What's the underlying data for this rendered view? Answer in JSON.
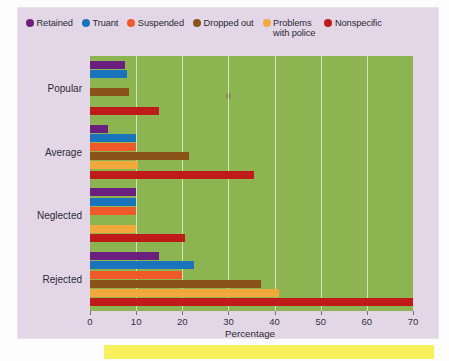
{
  "legend": {
    "items": [
      {
        "label": "Retained",
        "color": "#6b2080",
        "icon": "legend-dot-icon"
      },
      {
        "label": "Truant",
        "color": "#1a74bb",
        "icon": "legend-dot-icon"
      },
      {
        "label": "Suspended",
        "color": "#f05a28",
        "icon": "legend-dot-icon"
      },
      {
        "label": "Dropped out",
        "color": "#8a5418",
        "icon": "legend-dot-icon"
      },
      {
        "label": "Problems\nwith police",
        "color": "#f2a93b",
        "icon": "legend-dot-icon"
      },
      {
        "label": "Nonspecific",
        "color": "#bf1b1b",
        "icon": "legend-dot-icon"
      }
    ]
  },
  "chart_data": {
    "type": "bar",
    "orientation": "horizontal",
    "title": "",
    "xlabel": "Percentage",
    "ylabel": "",
    "xlim": [
      0,
      70
    ],
    "xticks": [
      0,
      10,
      20,
      30,
      40,
      50,
      60,
      70
    ],
    "xticklabels": [
      "0",
      "10",
      "20",
      "30",
      "40",
      "50",
      "60",
      "70"
    ],
    "grid": "vertical",
    "legend_position": "top",
    "plot_background": "#8cb552",
    "panel_background": "#e3d6e6",
    "categories": [
      "Popular",
      "Average",
      "Neglected",
      "Rejected"
    ],
    "series": [
      {
        "name": "Retained",
        "color": "#6b2080",
        "values": [
          7.5,
          4.0,
          10.0,
          15.0
        ]
      },
      {
        "name": "Truant",
        "color": "#1a74bb",
        "values": [
          8.0,
          10.0,
          10.0,
          22.5
        ]
      },
      {
        "name": "Suspended",
        "color": "#f05a28",
        "values": [
          0.0,
          10.0,
          10.0,
          20.0
        ]
      },
      {
        "name": "Dropped out",
        "color": "#8a5418",
        "values": [
          8.5,
          21.5,
          0.0,
          37.0
        ]
      },
      {
        "name": "Problems with police",
        "color": "#f2a93b",
        "values": [
          0.0,
          10.5,
          10.0,
          41.0
        ]
      },
      {
        "name": "Nonspecific",
        "color": "#bf1b1b",
        "values": [
          15.0,
          35.5,
          20.5,
          70.5
        ]
      }
    ]
  }
}
